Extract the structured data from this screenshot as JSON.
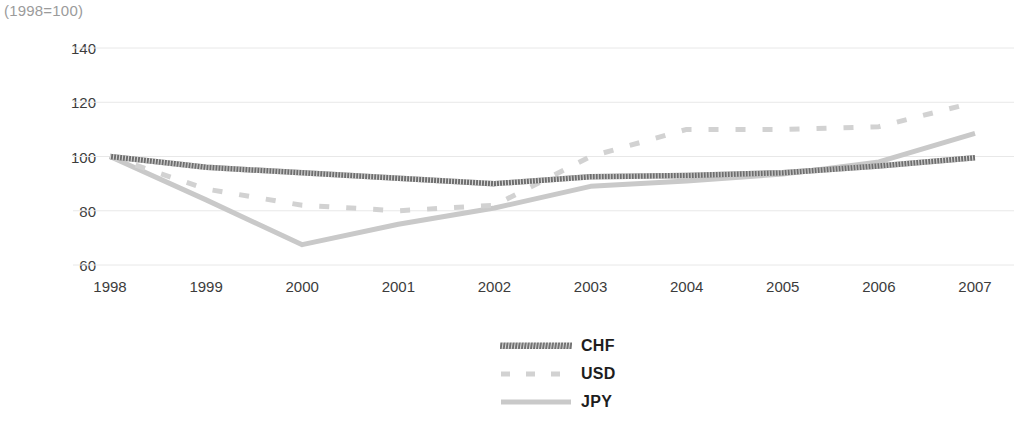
{
  "chart_data": {
    "type": "line",
    "title": "(1998=100)",
    "xlabel": "",
    "ylabel": "",
    "categories": [
      "1998",
      "1999",
      "2000",
      "2001",
      "2002",
      "2003",
      "2004",
      "2005",
      "2006",
      "2007"
    ],
    "x": [
      1998,
      1999,
      2000,
      2001,
      2002,
      2003,
      2004,
      2005,
      2006,
      2007
    ],
    "ylim": [
      60,
      140
    ],
    "yticks": [
      60,
      80,
      100,
      120,
      140
    ],
    "ytick_labels": [
      "60",
      "80",
      "100",
      "120",
      "140"
    ],
    "grid": "horizontal",
    "legend_position": "bottom-center",
    "series": [
      {
        "name": "CHF",
        "style": "solid-hatched-thick",
        "color": "#6e6e6e",
        "values": [
          100,
          96,
          94,
          92,
          90,
          92.5,
          93,
          94,
          96.5,
          99.5
        ]
      },
      {
        "name": "USD",
        "style": "dashed",
        "color": "#d2d2d2",
        "values": [
          100,
          88,
          82,
          80,
          82,
          100,
          110,
          110,
          111,
          120
        ]
      },
      {
        "name": "JPY",
        "style": "solid",
        "color": "#c9c9c9",
        "values": [
          100,
          84,
          67.5,
          75,
          81,
          89,
          91,
          93.5,
          98,
          108.5
        ]
      }
    ]
  },
  "legend": {
    "items": [
      {
        "label": "CHF",
        "swatch": "hatched-line-swatch"
      },
      {
        "label": "USD",
        "swatch": "dashed-line-swatch"
      },
      {
        "label": "JPY",
        "swatch": "solid-line-swatch"
      }
    ]
  },
  "colors": {
    "gridline": "#e8e8e8",
    "chf": "#6e6e6e",
    "usd": "#d2d2d2",
    "jpy": "#c9c9c9",
    "axis_text": "#3c3c3c",
    "title_text": "#9b9b9b"
  }
}
